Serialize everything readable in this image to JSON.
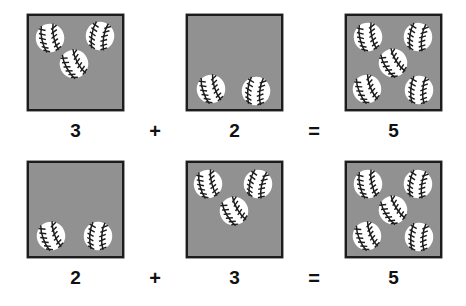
{
  "page": {
    "background_color": "#ffffff",
    "box_fill_color": "#919191",
    "box_border_color": "#1c1c1c",
    "ball_fill_color": "#ffffff",
    "ball_seam_color": "#1c1c1c",
    "text_color": "#111111"
  },
  "equations": [
    {
      "id": "equation-1",
      "expression": "3 + 2 = 5",
      "addend_1": "3",
      "operator": "+",
      "addend_2": "2",
      "equals": "=",
      "sum": "5",
      "boxes": [
        {
          "name": "addend-1-box",
          "count": 3,
          "balls": [
            {
              "x": 6,
              "y": 7,
              "rot": -12
            },
            {
              "x": 56,
              "y": 5,
              "rot": 10
            },
            {
              "x": 30,
              "y": 33,
              "rot": -28
            }
          ]
        },
        {
          "name": "addend-2-box",
          "count": 2,
          "balls": [
            {
              "x": 8,
              "y": 58,
              "rot": -18
            },
            {
              "x": 53,
              "y": 60,
              "rot": 6
            }
          ]
        },
        {
          "name": "sum-box",
          "count": 5,
          "balls": [
            {
              "x": 6,
              "y": 6,
              "rot": -12
            },
            {
              "x": 56,
              "y": 6,
              "rot": 8
            },
            {
              "x": 31,
              "y": 32,
              "rot": -32
            },
            {
              "x": 5,
              "y": 58,
              "rot": -22
            },
            {
              "x": 57,
              "y": 59,
              "rot": 4
            }
          ]
        }
      ]
    },
    {
      "id": "equation-2",
      "expression": "2 + 3 = 5",
      "addend_1": "2",
      "operator": "+",
      "addend_2": "3",
      "equals": "=",
      "sum": "5",
      "boxes": [
        {
          "name": "addend-1-box",
          "count": 2,
          "balls": [
            {
              "x": 7,
              "y": 58,
              "rot": -20
            },
            {
              "x": 54,
              "y": 58,
              "rot": 4
            }
          ]
        },
        {
          "name": "addend-2-box",
          "count": 3,
          "balls": [
            {
              "x": 5,
              "y": 6,
              "rot": -14
            },
            {
              "x": 55,
              "y": 6,
              "rot": 12
            },
            {
              "x": 31,
              "y": 33,
              "rot": -30
            }
          ]
        },
        {
          "name": "sum-box",
          "count": 5,
          "balls": [
            {
              "x": 6,
              "y": 6,
              "rot": -12
            },
            {
              "x": 56,
              "y": 6,
              "rot": 8
            },
            {
              "x": 31,
              "y": 32,
              "rot": -32
            },
            {
              "x": 5,
              "y": 58,
              "rot": -22
            },
            {
              "x": 57,
              "y": 59,
              "rot": 4
            }
          ]
        }
      ]
    }
  ]
}
